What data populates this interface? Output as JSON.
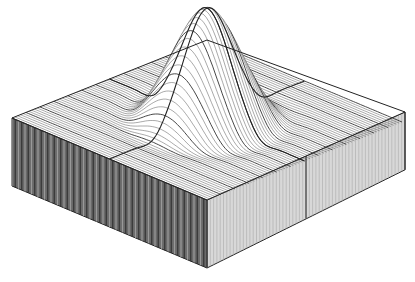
{
  "chart_data": {
    "type": "surface3d",
    "title": "",
    "xlabel": "",
    "ylabel": "",
    "zlabel": "",
    "function": "z = exp(-(x^2+y^2)/s) ridge/peak surface (sinc-like bump)",
    "x_range": [
      -1,
      1
    ],
    "y_range": [
      -1,
      1
    ],
    "z_range": [
      0,
      1
    ],
    "grid": false,
    "legend": false,
    "rendering": "wireframe-lines with solid base block",
    "projection": {
      "left_corner": [
        12,
        118
      ],
      "front_corner": [
        207,
        200
      ],
      "right_corner": [
        405,
        112
      ],
      "back_corner": [
        207,
        40
      ],
      "peak": [
        207,
        8
      ],
      "base_depth_px": 68
    },
    "colors": {
      "background": "#ffffff",
      "line": "#555555",
      "edge": "#222222",
      "left_face": "#6a6a6a",
      "right_face": "#d8d8d8"
    }
  }
}
